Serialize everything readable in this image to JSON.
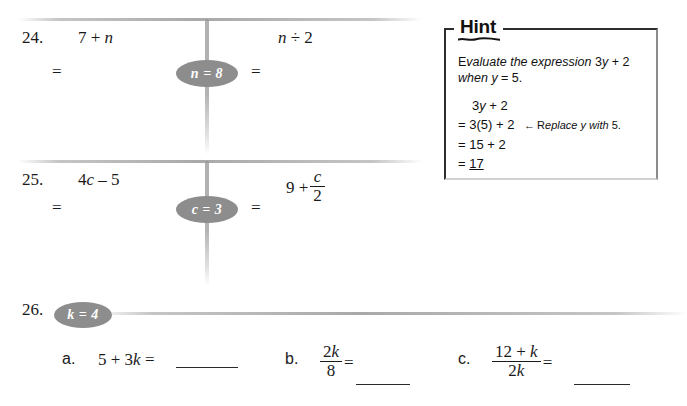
{
  "page": {
    "background": "#ffffff",
    "ink_color": "#1a1a1a",
    "badge_color": "#8d8d8d",
    "rule_color": "#969696"
  },
  "problems": [
    {
      "number": "24.",
      "badge": "n = 8",
      "left_expression": "7 + n",
      "left_equals": "=",
      "right_expression": "n ÷ 2",
      "right_equals": "="
    },
    {
      "number": "25.",
      "badge": "c = 3",
      "left_expression": "4c – 5",
      "left_equals": "=",
      "right_expression_prefix": "9 +",
      "right_fraction_numerator": "c",
      "right_fraction_denominator": "2",
      "right_equals": "="
    },
    {
      "number": "26.",
      "badge": "k = 4",
      "parts": [
        {
          "letter": "a.",
          "expression": "5 + 3k",
          "equals": "=",
          "answer": ""
        },
        {
          "letter": "b.",
          "fraction_numerator": "2k",
          "fraction_denominator": "8",
          "equals": "=",
          "answer": ""
        },
        {
          "letter": "c.",
          "fraction_numerator": "12 + k",
          "fraction_denominator": "2k",
          "equals": "=",
          "answer": ""
        }
      ]
    }
  ],
  "hint": {
    "title": "Hint",
    "lead_line1": "Evaluate the expression 3y + 2",
    "lead_line2": "when y = 5.",
    "step1": "3y + 2",
    "step2": "= 3(5) + 2",
    "step2_arrow": "←",
    "step2_note": "Replace y with 5.",
    "step3": "= 15 + 2",
    "step4_equals": "=",
    "step4_value": "17"
  }
}
